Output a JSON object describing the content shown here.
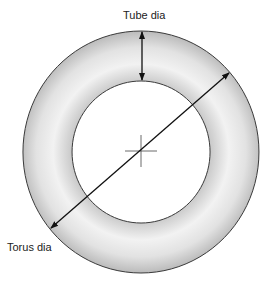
{
  "diagram": {
    "labels": {
      "tube_dia": "Tube dia",
      "torus_dia": "Torus dia"
    },
    "colors": {
      "torus_fill_light": "#f4f4f4",
      "torus_fill_dark": "#bdbdbd",
      "outline": "#333333",
      "arrow": "#111111",
      "background": "#ffffff"
    }
  }
}
